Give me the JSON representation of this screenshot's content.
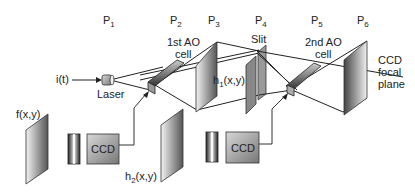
{
  "diagram": {
    "type": "optical-system-schematic",
    "planes": [
      {
        "id": "P1",
        "label": "P",
        "sub": "1"
      },
      {
        "id": "P2",
        "label": "P",
        "sub": "2"
      },
      {
        "id": "P3",
        "label": "P",
        "sub": "3"
      },
      {
        "id": "P4",
        "label": "P",
        "sub": "4"
      },
      {
        "id": "P5",
        "label": "P",
        "sub": "5"
      },
      {
        "id": "P6",
        "label": "P",
        "sub": "6"
      }
    ],
    "labels": {
      "input_signal": "i(t)",
      "laser": "Laser",
      "ao_cell_1_line1": "1st AO",
      "ao_cell_1_line2": "cell",
      "ao_cell_2_line1": "2nd AO",
      "ao_cell_2_line2": "cell",
      "slit": "Slit",
      "h1_base": "h",
      "h1_sub": "1",
      "h1_args": "(x,y)",
      "h2_base": "h",
      "h2_sub": "2",
      "h2_args": "(x,y)",
      "f": "f(x,y)",
      "ccd_1": "CCD",
      "ccd_2": "CCD",
      "ccd_focal_line1": "CCD",
      "ccd_focal_line2": "focal",
      "ccd_focal_line3": "plane"
    }
  }
}
